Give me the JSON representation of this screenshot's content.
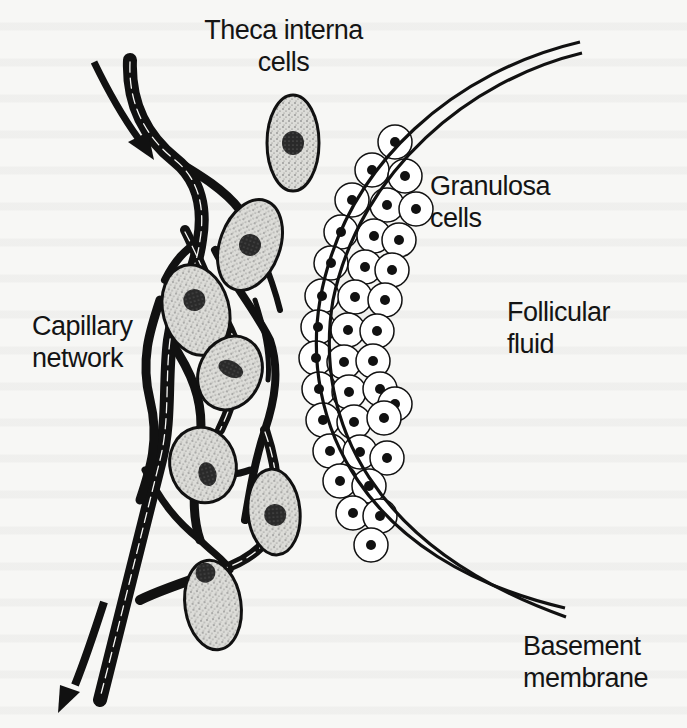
{
  "figure": {
    "type": "anatomical diagram",
    "colors": {
      "ink": "#141414",
      "paper": "#f7f7f5",
      "cell_fill": "#d9d9d6",
      "granulosa_fill": "#ffffff"
    }
  },
  "labels": {
    "theca_interna": {
      "line1": "Theca interna",
      "line2": "cells"
    },
    "granulosa": {
      "line1": "Granulosa",
      "line2": "cells"
    },
    "follicular_fluid": {
      "line1": "Follicular",
      "line2": "fluid"
    },
    "capillary_network": {
      "line1": "Capillary",
      "line2": "network"
    },
    "basement_membrane": {
      "line1": "Basement",
      "line2": "membrane"
    }
  },
  "arrows": [
    {
      "name": "blood-inflow",
      "direction": "down-right"
    },
    {
      "name": "blood-outflow",
      "direction": "down-left"
    }
  ]
}
